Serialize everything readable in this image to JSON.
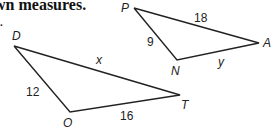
{
  "heading": {
    "text": "wn measures."
  },
  "item": {
    "number": "2."
  },
  "triangles": [
    {
      "name": "DOT",
      "vertices": {
        "D": {
          "label": "D"
        },
        "O": {
          "label": "O"
        },
        "T": {
          "label": "T"
        }
      },
      "sides": {
        "DO": {
          "label": "12"
        },
        "OT": {
          "label": "16"
        },
        "DT": {
          "label": "x"
        }
      }
    },
    {
      "name": "PNA",
      "vertices": {
        "P": {
          "label": "P"
        },
        "N": {
          "label": "N"
        },
        "A": {
          "label": "A"
        }
      },
      "sides": {
        "PN": {
          "label": "9"
        },
        "PA": {
          "label": "18"
        },
        "NA": {
          "label": "y"
        }
      }
    }
  ]
}
